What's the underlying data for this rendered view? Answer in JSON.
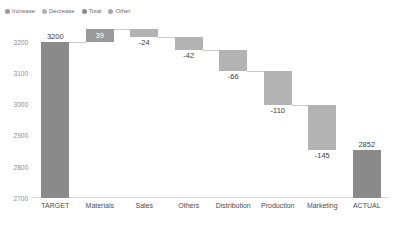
{
  "legend": {
    "position": "top-left",
    "items": [
      {
        "label": "Increase",
        "color": "#9a9a9a"
      },
      {
        "label": "Decrease",
        "color": "#b3b3b3"
      },
      {
        "label": "Total",
        "color": "#8a8a8a"
      },
      {
        "label": "Other",
        "color": "#a8a8a8"
      }
    ]
  },
  "chart_data": {
    "type": "bar",
    "subtype": "waterfall",
    "title": "",
    "xlabel": "",
    "ylabel": "",
    "ylim": [
      2700,
      3250
    ],
    "grid": false,
    "yticks": [
      3200,
      3100,
      3000,
      2900,
      2800,
      2700
    ],
    "ytick_labels": [
      "3200",
      "3100",
      "3000",
      "2900",
      "2800",
      "2700"
    ],
    "categories": [
      "TARGET",
      "Materials",
      "Sales",
      "Others",
      "Distribution",
      "Production",
      "Marketing",
      "ACTUAL"
    ],
    "values": [
      3200,
      39,
      -24,
      -42,
      -66,
      -110,
      -145,
      2852
    ],
    "data_labels": [
      "3200",
      "39",
      "-24",
      "-42",
      "-66",
      "-110",
      "-145",
      "2852"
    ],
    "kinds": [
      "total",
      "increase",
      "decrease",
      "decrease",
      "decrease",
      "decrease",
      "decrease",
      "total"
    ],
    "cumulative_start": [
      2700,
      3200,
      3215,
      3173,
      3107,
      2997,
      2852,
      2700
    ],
    "cumulative_end": [
      3200,
      3239,
      3191,
      3131,
      3041,
      2887,
      2707,
      2852
    ],
    "bar_tops": [
      3200,
      3239,
      3239,
      3215,
      3173,
      3107,
      2997,
      2852
    ],
    "bar_bottoms": [
      2700,
      3200,
      3215,
      3173,
      3107,
      2997,
      2852,
      2700
    ],
    "colors": {
      "total": "#8a8a8a",
      "increase": "#9a9a9a",
      "decrease": "#b3b3b3",
      "other": "#a8a8a8"
    }
  }
}
